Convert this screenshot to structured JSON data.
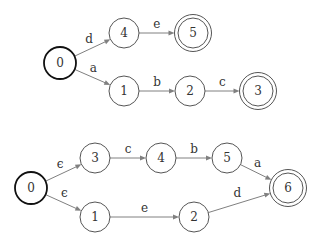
{
  "diagrams": [
    {
      "name": "dfa-top",
      "nodes": [
        {
          "id": "0",
          "label": "0",
          "x": 60,
          "y": 63,
          "start": true,
          "accept": false
        },
        {
          "id": "4",
          "label": "4",
          "x": 124,
          "y": 33,
          "start": false,
          "accept": false
        },
        {
          "id": "5",
          "label": "5",
          "x": 193,
          "y": 33,
          "start": false,
          "accept": true
        },
        {
          "id": "1",
          "label": "1",
          "x": 124,
          "y": 91,
          "start": false,
          "accept": false
        },
        {
          "id": "2",
          "label": "2",
          "x": 190,
          "y": 91,
          "start": false,
          "accept": false
        },
        {
          "id": "3",
          "label": "3",
          "x": 258,
          "y": 91,
          "start": false,
          "accept": true
        }
      ],
      "edges": [
        {
          "from": "0",
          "to": "4",
          "label": "d"
        },
        {
          "from": "4",
          "to": "5",
          "label": "e"
        },
        {
          "from": "0",
          "to": "1",
          "label": "a"
        },
        {
          "from": "1",
          "to": "2",
          "label": "b"
        },
        {
          "from": "2",
          "to": "3",
          "label": "c"
        }
      ]
    },
    {
      "name": "nfa-bottom",
      "nodes": [
        {
          "id": "0",
          "label": "0",
          "x": 31,
          "y": 188,
          "start": true,
          "accept": false
        },
        {
          "id": "3",
          "label": "3",
          "x": 95,
          "y": 158,
          "start": false,
          "accept": false
        },
        {
          "id": "4",
          "label": "4",
          "x": 161,
          "y": 158,
          "start": false,
          "accept": false
        },
        {
          "id": "5",
          "label": "5",
          "x": 227,
          "y": 158,
          "start": false,
          "accept": false
        },
        {
          "id": "6",
          "label": "6",
          "x": 288,
          "y": 188,
          "start": false,
          "accept": true
        },
        {
          "id": "1",
          "label": "1",
          "x": 95,
          "y": 217,
          "start": false,
          "accept": false
        },
        {
          "id": "2",
          "label": "2",
          "x": 194,
          "y": 217,
          "start": false,
          "accept": false
        }
      ],
      "edges": [
        {
          "from": "0",
          "to": "3",
          "label": "ϵ"
        },
        {
          "from": "3",
          "to": "4",
          "label": "c"
        },
        {
          "from": "4",
          "to": "5",
          "label": "b"
        },
        {
          "from": "5",
          "to": "6",
          "label": "a"
        },
        {
          "from": "0",
          "to": "1",
          "label": "ϵ"
        },
        {
          "from": "1",
          "to": "2",
          "label": "e"
        },
        {
          "from": "2",
          "to": "6",
          "label": "d"
        }
      ]
    }
  ],
  "style": {
    "node_stroke": "#555555",
    "start_stroke": "#111111",
    "edge_color": "#808080",
    "text_color": "#333333",
    "node_radius": 15,
    "accept_outer_radius": 18.5
  }
}
